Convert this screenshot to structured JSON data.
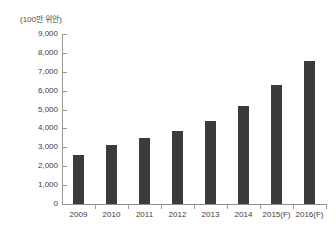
{
  "top_clipped_text": "",
  "chart_data": {
    "type": "bar",
    "title": "",
    "subtitle": "",
    "unit_label": "(100만 위안)",
    "xlabel": "",
    "ylabel": "",
    "categories": [
      "2009",
      "2010",
      "2011",
      "2012",
      "2013",
      "2014",
      "2015(F)",
      "2016(F)"
    ],
    "values": [
      2600,
      3100,
      3500,
      3850,
      4400,
      5200,
      6300,
      7550
    ],
    "ylim": [
      0,
      9000
    ],
    "ytick_values": [
      0,
      1000,
      2000,
      3000,
      4000,
      5000,
      6000,
      7000,
      8000,
      9000
    ],
    "ytick_labels": [
      "0",
      "1,000",
      "2,000",
      "3,000",
      "4,000",
      "5,000",
      "6,000",
      "7,000",
      "8,000",
      "9,000"
    ],
    "grid": false,
    "legend": null,
    "bar_color": "#3b3b3b",
    "axis_color": "#9a9a9a",
    "text_color": "#3d3d3d",
    "background": "#ffffff"
  }
}
